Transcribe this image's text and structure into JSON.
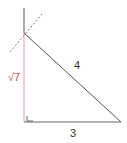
{
  "diagram": {
    "type": "right-triangle",
    "labels": {
      "vertical_leg": "√7",
      "hypotenuse": "4",
      "base": "3"
    },
    "colors": {
      "vertical_leg": "#e8a0a0",
      "vertical_label": "#c0504d",
      "lines": "#555555",
      "dashed": "#777777"
    }
  }
}
